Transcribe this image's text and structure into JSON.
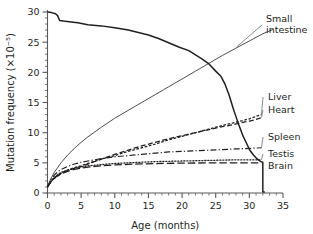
{
  "chart_data": {
    "type": "line",
    "title": "",
    "xlabel": "Age (months)",
    "ylabel": "Mutation frequency (×10⁻⁵)",
    "xlim": [
      0,
      35
    ],
    "ylim": [
      0,
      30
    ],
    "xticks": [
      0,
      5,
      10,
      15,
      20,
      25,
      30,
      35
    ],
    "yticks": [
      0,
      5,
      10,
      15,
      20,
      25,
      30
    ],
    "xtick_labels": [
      "0",
      "5",
      "10",
      "15",
      "20",
      "25",
      "30",
      "35"
    ],
    "ytick_labels": [
      "0",
      "5",
      "10",
      "15",
      "20",
      "25",
      "30"
    ],
    "xminor_step": 1,
    "yminor_step": 1,
    "grid": false,
    "legend_position": "right-inline-labels",
    "series": [
      {
        "name": "Survival",
        "label": "",
        "style": "solid",
        "stroke_width": 1.5,
        "x": [
          0,
          0.6,
          1.2,
          1.5,
          1.8,
          2.4,
          3.2,
          4.5,
          6,
          8,
          10,
          12,
          13.5,
          15,
          16.5,
          18,
          19.5,
          21,
          22,
          23,
          24,
          25,
          25.8,
          26.4,
          27,
          27.6,
          28,
          28.4,
          29,
          29.6,
          30,
          30.6,
          31.2,
          31.7,
          32,
          32,
          32.3
        ],
        "y": [
          30,
          29.9,
          29.7,
          29.4,
          28.6,
          28.5,
          28.4,
          28.2,
          27.9,
          27.7,
          27.4,
          27.0,
          26.6,
          26.2,
          25.6,
          24.9,
          24.2,
          23.6,
          22.9,
          22.2,
          21.4,
          20.2,
          19.3,
          18.0,
          16.2,
          14.0,
          12.7,
          11.4,
          9.6,
          8.2,
          7.2,
          6.3,
          5.6,
          5.2,
          5.1,
          0.15,
          0.15
        ]
      },
      {
        "name": "Small intestine",
        "label": "Small\nintestine",
        "style": "solid",
        "stroke_width": 0.8,
        "x": [
          0,
          0.5,
          1,
          2,
          3,
          4,
          5,
          6,
          8,
          10,
          12,
          14,
          16,
          18,
          20,
          22,
          24,
          26,
          28,
          30,
          32,
          33.5
        ],
        "y": [
          1.0,
          2.4,
          3.4,
          5.0,
          6.3,
          7.4,
          8.4,
          9.3,
          10.9,
          12.4,
          13.7,
          15.0,
          16.3,
          17.6,
          18.9,
          20.2,
          21.5,
          22.8,
          24.0,
          25.2,
          26.4,
          27.1
        ]
      },
      {
        "name": "Liver",
        "label": "Liver",
        "style": "fine-dash",
        "stroke_width": 1.3,
        "x": [
          0,
          0.6,
          1.2,
          2,
          3,
          4,
          5,
          6,
          8,
          10,
          12,
          14,
          16,
          18,
          20,
          22,
          24,
          26,
          27.5,
          29,
          30,
          31,
          31.8
        ],
        "y": [
          1.0,
          2.1,
          2.7,
          3.3,
          3.8,
          4.2,
          4.5,
          4.9,
          5.6,
          6.2,
          6.9,
          7.5,
          8.1,
          8.8,
          9.4,
          10.0,
          10.6,
          11.2,
          11.6,
          12.0,
          12.3,
          12.7,
          13.0
        ]
      },
      {
        "name": "Heart",
        "label": "Heart",
        "style": "dash",
        "stroke_width": 1.3,
        "x": [
          0,
          0.6,
          1.2,
          2,
          3,
          4,
          5,
          6,
          8,
          10,
          12,
          14,
          16,
          18,
          20,
          22,
          24,
          26,
          27.5,
          29,
          30,
          31,
          31.8
        ],
        "y": [
          1.0,
          2.0,
          2.6,
          3.2,
          3.7,
          4.1,
          4.4,
          4.8,
          5.6,
          6.4,
          7.1,
          7.8,
          8.4,
          9.0,
          9.5,
          10.0,
          10.5,
          11.0,
          11.3,
          11.7,
          11.9,
          12.2,
          12.5
        ]
      },
      {
        "name": "Spleen",
        "label": "Spleen",
        "style": "dash-dot",
        "stroke_width": 1.2,
        "x": [
          0,
          0.6,
          1.2,
          2,
          3,
          4,
          5,
          6,
          8,
          10,
          12,
          14,
          16,
          18,
          20,
          22,
          24,
          26,
          28,
          30,
          31.8
        ],
        "y": [
          1.0,
          2.4,
          3.2,
          3.9,
          4.4,
          4.8,
          5.1,
          5.3,
          5.7,
          6.0,
          6.2,
          6.4,
          6.6,
          6.8,
          6.9,
          7.0,
          7.1,
          7.2,
          7.3,
          7.4,
          7.5
        ]
      },
      {
        "name": "Testis",
        "label": "Testis",
        "style": "dot",
        "stroke_width": 1.3,
        "x": [
          0,
          0.6,
          1.2,
          2,
          3,
          4,
          5,
          6,
          8,
          10,
          12,
          14,
          16,
          18,
          20,
          22,
          24,
          26,
          28,
          30,
          31.8
        ],
        "y": [
          1.0,
          2.1,
          2.8,
          3.4,
          3.8,
          4.1,
          4.3,
          4.5,
          4.7,
          4.9,
          5.0,
          5.1,
          5.2,
          5.25,
          5.3,
          5.35,
          5.4,
          5.45,
          5.5,
          5.5,
          5.5
        ]
      },
      {
        "name": "Brain",
        "label": "Brain",
        "style": "long-dash",
        "stroke_width": 1.3,
        "x": [
          0,
          0.6,
          1.2,
          2,
          3,
          4,
          5,
          6,
          8,
          10,
          12,
          14,
          16,
          18,
          20,
          22,
          24,
          26,
          28,
          30,
          31.8
        ],
        "y": [
          1.0,
          2.0,
          2.6,
          3.2,
          3.6,
          3.9,
          4.1,
          4.3,
          4.5,
          4.65,
          4.75,
          4.82,
          4.88,
          4.92,
          4.95,
          4.97,
          4.99,
          5.0,
          5.0,
          5.0,
          5.0
        ]
      }
    ],
    "annotations": [
      {
        "name": "small-intestine",
        "text_lines": [
          "Small",
          "intestine"
        ],
        "x": 266,
        "y": 22
      },
      {
        "name": "liver",
        "text_lines": [
          "Liver"
        ],
        "x": 268,
        "y": 100
      },
      {
        "name": "heart",
        "text_lines": [
          "Heart"
        ],
        "x": 268,
        "y": 113
      },
      {
        "name": "spleen",
        "text_lines": [
          "Spleen"
        ],
        "x": 268,
        "y": 140
      },
      {
        "name": "testis",
        "text_lines": [
          "Testis"
        ],
        "x": 268,
        "y": 157
      },
      {
        "name": "brain",
        "text_lines": [
          "Brain"
        ],
        "x": 268,
        "y": 169
      }
    ]
  }
}
